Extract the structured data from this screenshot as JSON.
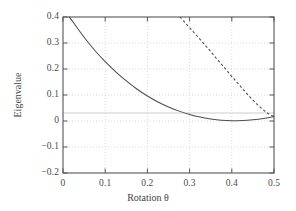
{
  "chart_data": {
    "type": "line",
    "title": "",
    "xlabel": "Rotation θ",
    "ylabel": "Eigenvalue",
    "xlim": [
      0,
      0.5
    ],
    "ylim": [
      -0.2,
      0.4
    ],
    "xticks": [
      "0",
      "0.1",
      "0.2",
      "0.3",
      "0.4",
      "0.5"
    ],
    "xtick_values": [
      0,
      0.1,
      0.2,
      0.3,
      0.4,
      0.5
    ],
    "yticks": [
      "0.4",
      "0.3",
      "0.2",
      "0.1",
      "0",
      "−0.1",
      "−0.2"
    ],
    "ytick_values": [
      0.4,
      0.3,
      0.2,
      0.1,
      0,
      -0.1,
      -0.2
    ],
    "grid": true,
    "grid_style": "dotted",
    "legend": "none",
    "series": [
      {
        "name": "lower-eigenvalue",
        "style": "solid",
        "color": "#4d4d4d",
        "x": [
          0.015,
          0.025,
          0.05,
          0.075,
          0.1,
          0.125,
          0.15,
          0.175,
          0.2,
          0.225,
          0.25,
          0.275,
          0.3,
          0.325,
          0.35,
          0.375,
          0.4,
          0.425,
          0.45,
          0.475,
          0.5
        ],
        "y": [
          0.4,
          0.378,
          0.322,
          0.272,
          0.228,
          0.189,
          0.154,
          0.123,
          0.096,
          0.073,
          0.054,
          0.038,
          0.025,
          0.015,
          0.008,
          0.003,
          0.001,
          0.002,
          0.005,
          0.01,
          0.017
        ]
      },
      {
        "name": "upper-eigenvalue",
        "style": "dashed",
        "color": "#4d4d4d",
        "x": [
          0.277,
          0.29,
          0.305,
          0.32,
          0.335,
          0.35,
          0.365,
          0.38,
          0.395,
          0.41,
          0.425,
          0.44,
          0.455,
          0.47,
          0.485,
          0.5
        ],
        "y": [
          0.4,
          0.377,
          0.35,
          0.323,
          0.295,
          0.267,
          0.238,
          0.21,
          0.181,
          0.153,
          0.125,
          0.098,
          0.072,
          0.049,
          0.03,
          0.017
        ]
      }
    ],
    "colors": {
      "axis": "#555555",
      "grid": "#cccccc",
      "zero_line": "#bbbbbb",
      "background": "#ffffff",
      "text": "#3f3f3f"
    }
  },
  "axes": {
    "x_title": "Rotation θ",
    "y_title": "Eigenvalue"
  }
}
